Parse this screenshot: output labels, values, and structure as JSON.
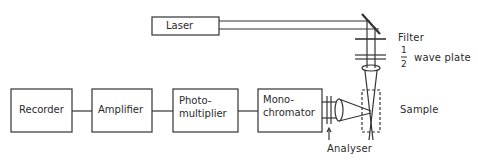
{
  "diagram": {
    "type": "optical-setup-block-diagram",
    "colors": {
      "line": "#333333",
      "background": "#ffffff"
    },
    "blocks": [
      {
        "id": "laser",
        "label": "Laser"
      },
      {
        "id": "recorder",
        "label": "Recorder"
      },
      {
        "id": "amplifier",
        "label": "Amplifier"
      },
      {
        "id": "photomultiplier",
        "label_line1": "Photo-",
        "label_line2": "multiplier"
      },
      {
        "id": "monochromator",
        "label_line1": "Mono-",
        "label_line2": "chromator"
      }
    ],
    "annotations": {
      "filter": "Filter",
      "half_numerator": "1",
      "half_denominator": "2",
      "wave_plate": "wave plate",
      "sample": "Sample",
      "analyser": "Analyser"
    },
    "connections": [
      [
        "recorder",
        "amplifier"
      ],
      [
        "amplifier",
        "photomultiplier"
      ],
      [
        "photomultiplier",
        "monochromator"
      ],
      [
        "monochromator",
        "analyser"
      ],
      [
        "laser",
        "mirror"
      ],
      [
        "mirror",
        "filter"
      ],
      [
        "filter",
        "half-wave-plate"
      ],
      [
        "half-wave-plate",
        "lens"
      ],
      [
        "lens",
        "sample"
      ]
    ]
  }
}
